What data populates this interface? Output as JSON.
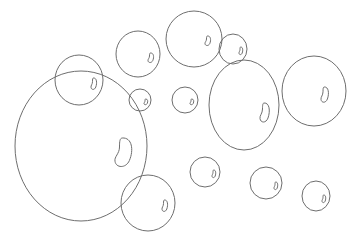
{
  "scene": {
    "width": 351,
    "height": 235,
    "background": "#ffffff",
    "stroke_color": "#6e6e6e",
    "bubbles": [
      {
        "id": "bubble-large",
        "cx": 81,
        "cy": 146,
        "rx": 66,
        "ry": 75,
        "hx": 124,
        "hy": 153,
        "hw": 9,
        "hh": 15
      },
      {
        "id": "bubble-top-left",
        "cx": 79,
        "cy": 80,
        "rx": 24,
        "ry": 25,
        "hx": 94,
        "hy": 84,
        "hw": 3,
        "hh": 6
      },
      {
        "id": "bubble-top-mid",
        "cx": 138,
        "cy": 54,
        "rx": 22,
        "ry": 23,
        "hx": 151,
        "hy": 58,
        "hw": 3,
        "hh": 5
      },
      {
        "id": "bubble-top-center",
        "cx": 194,
        "cy": 39,
        "rx": 28,
        "ry": 28,
        "hx": 208,
        "hy": 41,
        "hw": 3,
        "hh": 5
      },
      {
        "id": "bubble-top-small",
        "cx": 233,
        "cy": 49,
        "rx": 14,
        "ry": 15,
        "hx": 241,
        "hy": 51,
        "hw": 2,
        "hh": 4
      },
      {
        "id": "bubble-tall",
        "cx": 244,
        "cy": 105,
        "rx": 35,
        "ry": 45,
        "hx": 265,
        "hy": 113,
        "hw": 5,
        "hh": 10
      },
      {
        "id": "bubble-right",
        "cx": 314,
        "cy": 91,
        "rx": 32,
        "ry": 35,
        "hx": 325,
        "hy": 95,
        "hw": 4,
        "hh": 8
      },
      {
        "id": "bubble-small-left",
        "cx": 140,
        "cy": 100,
        "rx": 11,
        "ry": 11,
        "hx": 146,
        "hy": 102,
        "hw": 2,
        "hh": 3
      },
      {
        "id": "bubble-small-center",
        "cx": 185,
        "cy": 100,
        "rx": 13,
        "ry": 13,
        "hx": 192,
        "hy": 102,
        "hw": 2,
        "hh": 3
      },
      {
        "id": "bubble-bottom-left",
        "cx": 148,
        "cy": 203,
        "rx": 27,
        "ry": 28,
        "hx": 165,
        "hy": 206,
        "hw": 3,
        "hh": 6
      },
      {
        "id": "bubble-bottom-small",
        "cx": 205,
        "cy": 172,
        "rx": 15,
        "ry": 15,
        "hx": 214,
        "hy": 174,
        "hw": 2,
        "hh": 4
      },
      {
        "id": "bubble-bottom-mid",
        "cx": 266,
        "cy": 183,
        "rx": 16,
        "ry": 16,
        "hx": 276,
        "hy": 186,
        "hw": 2,
        "hh": 4
      },
      {
        "id": "bubble-bottom-right",
        "cx": 316,
        "cy": 196,
        "rx": 14,
        "ry": 15,
        "hx": 324,
        "hy": 199,
        "hw": 2,
        "hh": 4
      }
    ]
  }
}
